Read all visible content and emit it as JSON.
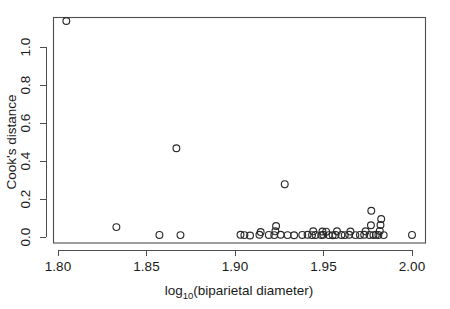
{
  "chart_data": {
    "type": "scatter",
    "title": "",
    "xlabel": "log10(biparietal diameter)",
    "xlabel_base": "log",
    "xlabel_subscript": "10",
    "xlabel_rest": "(biparietal diameter)",
    "ylabel": "Cook's distance",
    "xlim": [
      1.7965,
      2.0115
    ],
    "ylim": [
      -0.035,
      1.19
    ],
    "xticks": [
      1.8,
      1.85,
      1.9,
      1.95,
      2.0
    ],
    "xtick_labels": [
      "1.80",
      "1.85",
      "1.90",
      "1.95",
      "2.00"
    ],
    "yticks": [
      0.0,
      0.2,
      0.4,
      0.6,
      0.8,
      1.0
    ],
    "ytick_labels": [
      "0.0",
      "0.2",
      "0.4",
      "0.6",
      "0.8",
      "1.0"
    ],
    "grid": false,
    "legend": null,
    "marker": "open-circle",
    "marker_color": "#2b2b2b",
    "point_radius": 3.4,
    "points": [
      {
        "x": 1.8047,
        "y": 1.137
      },
      {
        "x": 1.833,
        "y": 0.052
      },
      {
        "x": 1.8573,
        "y": 0.011
      },
      {
        "x": 1.8669,
        "y": 0.467
      },
      {
        "x": 1.8692,
        "y": 0.01
      },
      {
        "x": 1.9031,
        "y": 0.012
      },
      {
        "x": 1.9053,
        "y": 0.01
      },
      {
        "x": 1.9085,
        "y": 0.008
      },
      {
        "x": 1.9138,
        "y": 0.012
      },
      {
        "x": 1.9145,
        "y": 0.026
      },
      {
        "x": 1.9191,
        "y": 0.011
      },
      {
        "x": 1.9222,
        "y": 0.01
      },
      {
        "x": 1.9228,
        "y": 0.03
      },
      {
        "x": 1.9232,
        "y": 0.058
      },
      {
        "x": 1.9258,
        "y": 0.012
      },
      {
        "x": 1.9281,
        "y": 0.278
      },
      {
        "x": 1.9297,
        "y": 0.01
      },
      {
        "x": 1.9334,
        "y": 0.009
      },
      {
        "x": 1.938,
        "y": 0.011
      },
      {
        "x": 1.941,
        "y": 0.012
      },
      {
        "x": 1.9435,
        "y": 0.01
      },
      {
        "x": 1.9442,
        "y": 0.03
      },
      {
        "x": 1.9455,
        "y": 0.011
      },
      {
        "x": 1.9487,
        "y": 0.01
      },
      {
        "x": 1.9494,
        "y": 0.029
      },
      {
        "x": 1.9499,
        "y": 0.012
      },
      {
        "x": 1.9515,
        "y": 0.028
      },
      {
        "x": 1.953,
        "y": 0.01
      },
      {
        "x": 1.9552,
        "y": 0.009
      },
      {
        "x": 1.9568,
        "y": 0.011
      },
      {
        "x": 1.9576,
        "y": 0.03
      },
      {
        "x": 1.9601,
        "y": 0.011
      },
      {
        "x": 1.962,
        "y": 0.01
      },
      {
        "x": 1.9645,
        "y": 0.012
      },
      {
        "x": 1.9652,
        "y": 0.029
      },
      {
        "x": 1.968,
        "y": 0.01
      },
      {
        "x": 1.9706,
        "y": 0.011
      },
      {
        "x": 1.973,
        "y": 0.012
      },
      {
        "x": 1.9738,
        "y": 0.03
      },
      {
        "x": 1.976,
        "y": 0.011
      },
      {
        "x": 1.9768,
        "y": 0.062
      },
      {
        "x": 1.977,
        "y": 0.138
      },
      {
        "x": 1.9782,
        "y": 0.01
      },
      {
        "x": 1.9796,
        "y": 0.012
      },
      {
        "x": 1.981,
        "y": 0.011
      },
      {
        "x": 1.9818,
        "y": 0.032
      },
      {
        "x": 1.9822,
        "y": 0.063
      },
      {
        "x": 1.9826,
        "y": 0.095
      },
      {
        "x": 1.984,
        "y": 0.01
      },
      {
        "x": 2.0,
        "y": 0.011
      }
    ]
  }
}
